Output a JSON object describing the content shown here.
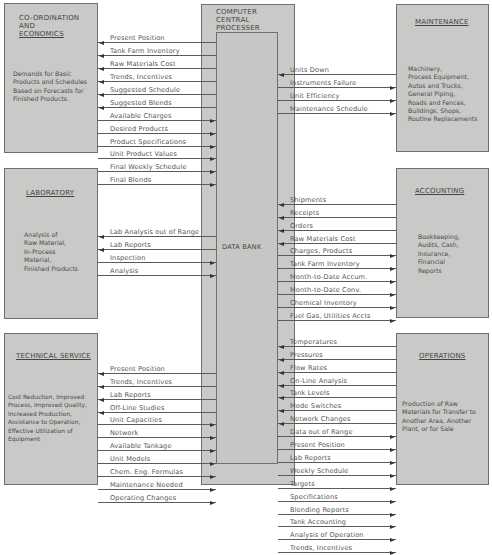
{
  "processor": {
    "title_lines": [
      "COMPUTER",
      "CENTRAL",
      "PROCESSER"
    ],
    "data_bank_label": "DATA BANK"
  },
  "departments": {
    "coordination": {
      "title_lines": [
        "CO-ORDINATION",
        "AND",
        "ECONOMICS"
      ],
      "description": "Demands for Basic\nProducts and Schedules\nBased on Forecasts for\nFinished Products.",
      "flows": [
        {
          "label": "Present Position",
          "direction": "to-department"
        },
        {
          "label": "Tank Farm Inventory",
          "direction": "to-department"
        },
        {
          "label": "Raw Materials Cost",
          "direction": "to-department"
        },
        {
          "label": "Trends, Incentives",
          "direction": "to-department"
        },
        {
          "label": "Suggested Schedule",
          "direction": "to-department"
        },
        {
          "label": "Suggested Blends",
          "direction": "to-department"
        },
        {
          "label": "Available Charges",
          "direction": "to-processor"
        },
        {
          "label": "Desired Products",
          "direction": "to-processor"
        },
        {
          "label": "Product Specifications",
          "direction": "to-processor"
        },
        {
          "label": "Unit Product Values",
          "direction": "to-processor"
        },
        {
          "label": "Final Weekly Schedule",
          "direction": "to-processor"
        },
        {
          "label": "Final Blends",
          "direction": "to-processor"
        }
      ]
    },
    "laboratory": {
      "title": "LABORATORY",
      "description": "Analysis of\nRaw Material,\nIn-Process\nMaterial,\nFinished Products",
      "flows": [
        {
          "label": "Lab Analysis out of Range",
          "direction": "to-department"
        },
        {
          "label": "Lab Reports",
          "direction": "to-department"
        },
        {
          "label": "Inspection",
          "direction": "to-processor"
        },
        {
          "label": "Analysis",
          "direction": "to-processor"
        }
      ]
    },
    "technical_service": {
      "title": "TECHNICAL SERVICE",
      "description": "Cost Reduction, Improved\nProcess, Improved Quality,\nIncreased Production,\nAssistance to Operation,\nEffective Utilization of\nEquipment",
      "flows": [
        {
          "label": "Present Position",
          "direction": "to-department"
        },
        {
          "label": "Trends, Incentives",
          "direction": "to-department"
        },
        {
          "label": "Lab Reports",
          "direction": "to-department"
        },
        {
          "label": "Off-Line Studies",
          "direction": "to-department"
        },
        {
          "label": "Unit Capacities",
          "direction": "to-processor"
        },
        {
          "label": "Network",
          "direction": "to-processor"
        },
        {
          "label": "Available Tankage",
          "direction": "to-processor"
        },
        {
          "label": "Unit Models",
          "direction": "to-processor"
        },
        {
          "label": "Chem. Eng. Formulas",
          "direction": "to-processor"
        },
        {
          "label": "Maintenance Needed",
          "direction": "to-processor"
        },
        {
          "label": "Operating Changes",
          "direction": "to-processor"
        }
      ]
    },
    "maintenance": {
      "title": "MAINTENANCE",
      "description": "Machinery,\nProcess Equipment,\nAutos and Trucks,\nGeneral Piping,\nRoads and Fences,\nBuildings, Shops,\nRoutine Replacements",
      "flows": [
        {
          "label": "Units Down",
          "direction": "to-processor"
        },
        {
          "label": "Instruments Failure",
          "direction": "to-department"
        },
        {
          "label": "Unit Efficiency",
          "direction": "to-department"
        },
        {
          "label": "Maintenance Schedule",
          "direction": "to-department"
        }
      ]
    },
    "accounting": {
      "title": "ACCOUNTING",
      "description": "Bookkeeping,\nAudits, Cash,\nInsurance,\nFinancial\nReports",
      "flows": [
        {
          "label": "Shipments",
          "direction": "to-processor"
        },
        {
          "label": "Receipts",
          "direction": "to-processor"
        },
        {
          "label": "Orders",
          "direction": "to-processor"
        },
        {
          "label": "Raw Materials Cost",
          "direction": "to-processor"
        },
        {
          "label": "Charges, Products",
          "direction": "to-department"
        },
        {
          "label": "Tank Farm Inventory",
          "direction": "to-department"
        },
        {
          "label": "Month-to-Date Accum.",
          "direction": "to-department"
        },
        {
          "label": "Month-to-Date Conv.",
          "direction": "to-department"
        },
        {
          "label": "Chemical Inventory",
          "direction": "to-department"
        },
        {
          "label": "Fuel Gas, Utilities Accts",
          "direction": "to-department"
        }
      ]
    },
    "operations": {
      "title": "OPERATIONS",
      "description": "Production of Raw\nMaterials for Transfer to\nAnother Area, Another\nPlant, or for Sale",
      "flows": [
        {
          "label": "Temperatures",
          "direction": "to-processor"
        },
        {
          "label": "Pressures",
          "direction": "to-processor"
        },
        {
          "label": "Flow Rates",
          "direction": "to-processor"
        },
        {
          "label": "On-Line Analysis",
          "direction": "to-processor"
        },
        {
          "label": "Tank Levels",
          "direction": "to-processor"
        },
        {
          "label": "Mode Switches",
          "direction": "to-processor"
        },
        {
          "label": "Network Changes",
          "direction": "to-processor"
        },
        {
          "label": "Data out of Range",
          "direction": "to-department"
        },
        {
          "label": "Present Position",
          "direction": "to-department"
        },
        {
          "label": "Lab Reports",
          "direction": "to-department"
        },
        {
          "label": "Weekly Schedule",
          "direction": "to-department"
        },
        {
          "label": "Targets",
          "direction": "to-department"
        },
        {
          "label": "Specifications",
          "direction": "to-department"
        },
        {
          "label": "Blending Reports",
          "direction": "to-department"
        },
        {
          "label": "Tank Accounting",
          "direction": "to-department"
        },
        {
          "label": "Analysis of Operation",
          "direction": "to-department"
        },
        {
          "label": "Trends, Incentives",
          "direction": "to-department"
        }
      ]
    }
  },
  "colors": {
    "box_fill": "#c9c9c7",
    "border": "#6f6f6f",
    "line": "#5a5a5a",
    "text": "#4a4a4a"
  }
}
